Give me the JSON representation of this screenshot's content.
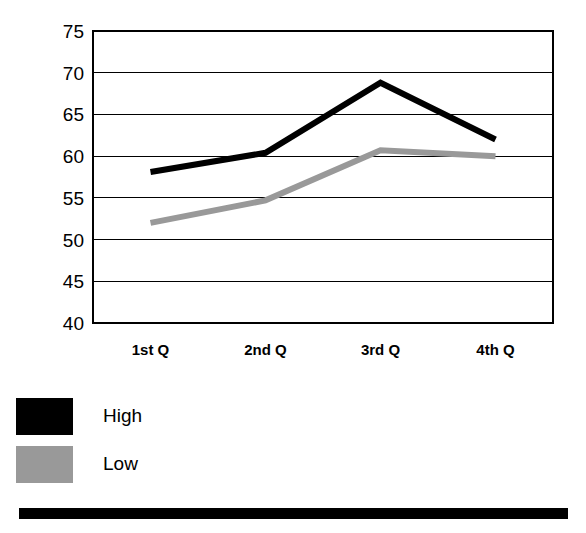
{
  "chart_data": {
    "type": "line",
    "title": "",
    "xlabel": "",
    "ylabel": "",
    "categories": [
      "1st Q",
      "2nd Q",
      "3rd Q",
      "4th Q"
    ],
    "series": [
      {
        "name": "High",
        "color": "#000000",
        "values": [
          58.1,
          60.4,
          68.8,
          62.0
        ]
      },
      {
        "name": "Low",
        "color": "#999999",
        "values": [
          52.0,
          54.7,
          60.7,
          60.0
        ]
      }
    ],
    "ylim": [
      40,
      75
    ],
    "yticks": [
      40,
      45,
      50,
      55,
      60,
      65,
      70,
      75
    ],
    "ytick_labels": [
      "40",
      "45",
      "50",
      "55",
      "60",
      "65",
      "70",
      "75"
    ],
    "grid": true,
    "grid_axis": "y",
    "legend_position": "below-left",
    "frame": true
  },
  "legend": {
    "items": [
      {
        "label": "High",
        "swatch_color": "#000000",
        "swatch_name": "legend-swatch-high"
      },
      {
        "label": "Low",
        "swatch_color": "#999999",
        "swatch_name": "legend-swatch-low"
      }
    ]
  },
  "decorations": {
    "bottom_rule_color": "#000000"
  },
  "colors": {
    "high": "#000000",
    "low": "#999999",
    "axis": "#000000",
    "background": "#ffffff"
  }
}
